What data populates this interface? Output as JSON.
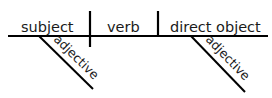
{
  "diagram": {
    "type": "sentence-diagram",
    "baseline_label_subject": "subject",
    "baseline_label_verb": "verb",
    "baseline_label_object": "direct object",
    "modifier_subject": "adjective",
    "modifier_object": "adjective",
    "line_color": "#000000",
    "text_color": "#1a1a1a",
    "background": "#ffffff"
  }
}
